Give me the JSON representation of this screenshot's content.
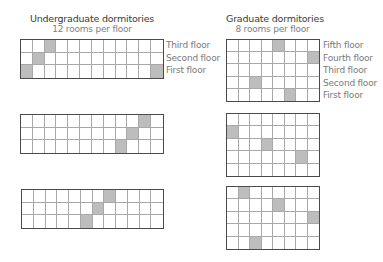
{
  "undergraduate": {
    "title": "Undergraduate dormitories",
    "subtitle": "12 rooms per floor",
    "columns": 12,
    "rows": 3,
    "floor_labels": [
      "Third floor",
      "Second floor",
      "First floor"
    ],
    "dorms": [
      {
        "shaded": [
          [
            0,
            2
          ],
          [
            1,
            1
          ],
          [
            2,
            0
          ],
          [
            2,
            11
          ]
        ]
      },
      {
        "shaded": [
          [
            0,
            10
          ],
          [
            1,
            9
          ],
          [
            2,
            8
          ]
        ]
      },
      {
        "shaded": [
          [
            0,
            7
          ],
          [
            1,
            6
          ],
          [
            2,
            5
          ]
        ]
      }
    ]
  },
  "graduate": {
    "title": "Graduate dormitories",
    "subtitle": "8 rooms per floor",
    "columns": 8,
    "rows": 5,
    "floor_labels": [
      "Fifth floor",
      "Fourth floor",
      "Third floor",
      "Second floor",
      "First floor"
    ],
    "dorms": [
      {
        "shaded": [
          [
            0,
            4
          ],
          [
            1,
            7
          ],
          [
            3,
            2
          ],
          [
            4,
            5
          ]
        ]
      },
      {
        "shaded": [
          [
            1,
            0
          ],
          [
            2,
            3
          ],
          [
            3,
            6
          ]
        ]
      },
      {
        "shaded": [
          [
            0,
            1
          ],
          [
            1,
            4
          ],
          [
            2,
            7
          ],
          [
            4,
            2
          ]
        ]
      }
    ]
  },
  "colors": {
    "shaded_room": "#bdbdbd",
    "empty_room": "#ffffff",
    "outer_border": "#4a4a4a",
    "inner_lines": "#a8a8a8"
  }
}
